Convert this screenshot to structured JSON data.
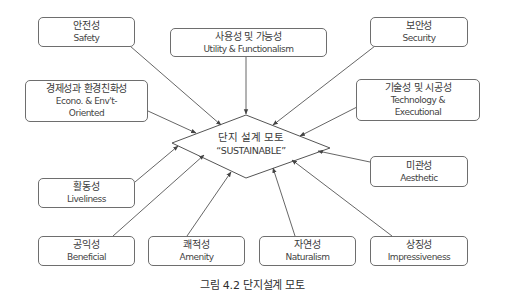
{
  "diagram": {
    "center": {
      "ko": "단지 설계 모토",
      "en": "“SUSTAINABLE”"
    },
    "nodes": [
      {
        "id": "safety",
        "ko": "안전성",
        "en": "Safety"
      },
      {
        "id": "utility",
        "ko": "사용성 및 가능성",
        "en": "Utility & Functionalism"
      },
      {
        "id": "security",
        "ko": "보안성",
        "en": "Security"
      },
      {
        "id": "econo",
        "ko": "경제성과 환경친화성",
        "en": "Econo. & Env't-",
        "en2": "Oriented"
      },
      {
        "id": "technology",
        "ko": "기술성 및 시공성",
        "en": "Technology &",
        "en2": "Executional"
      },
      {
        "id": "aesthetic",
        "ko": "미관성",
        "en": "Aesthetic"
      },
      {
        "id": "liveliness",
        "ko": "활동성",
        "en": "Liveliness"
      },
      {
        "id": "beneficial",
        "ko": "공익성",
        "en": "Beneficial"
      },
      {
        "id": "amenity",
        "ko": "쾌적성",
        "en": "Amenity"
      },
      {
        "id": "naturalism",
        "ko": "자연성",
        "en": "Naturalism"
      },
      {
        "id": "impressiveness",
        "ko": "상징성",
        "en": "Impressiveness"
      }
    ],
    "caption": "그림 4.2 단지설계 모토",
    "colors": {
      "line": "#555555",
      "border": "#6e6e6e",
      "text": "#3a3a3a"
    }
  }
}
